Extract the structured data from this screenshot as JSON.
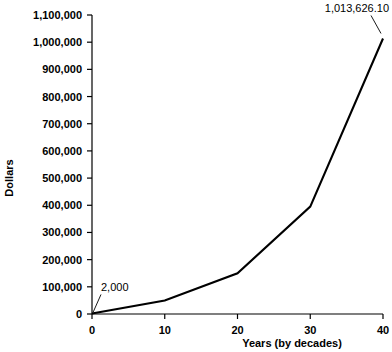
{
  "chart_data": {
    "type": "line",
    "title": "",
    "xlabel": "Years (by decades)",
    "ylabel": "Dollars",
    "x": [
      0,
      10,
      20,
      30,
      40
    ],
    "values": [
      2000,
      50000,
      150000,
      395000,
      1013626.1
    ],
    "series": [
      {
        "name": "Dollars",
        "values": [
          2000,
          50000,
          150000,
          395000,
          1013626.1
        ]
      }
    ],
    "xlim": [
      0,
      40
    ],
    "ylim": [
      0,
      1100000
    ],
    "xticks": [
      0,
      10,
      20,
      30,
      40
    ],
    "xtick_labels": [
      "0",
      "10",
      "20",
      "30",
      "40"
    ],
    "yticks": [
      0,
      100000,
      200000,
      300000,
      400000,
      500000,
      600000,
      700000,
      800000,
      900000,
      1000000,
      1100000
    ],
    "ytick_labels": [
      "0",
      "100,000",
      "200,000",
      "300,000",
      "400,000",
      "500,000",
      "600,000",
      "700,000",
      "800,000",
      "900,000",
      "1,000,000",
      "1,100,000"
    ],
    "grid": false,
    "legend": false,
    "annotations": [
      {
        "name": "start-value",
        "text": "2,000",
        "x": 0,
        "y": 2000
      },
      {
        "name": "end-value",
        "text": "1,013,626.10",
        "x": 40,
        "y": 1013626.1
      }
    ],
    "line_color": "#000000",
    "axis_color": "#000000",
    "background_color": "#ffffff"
  }
}
